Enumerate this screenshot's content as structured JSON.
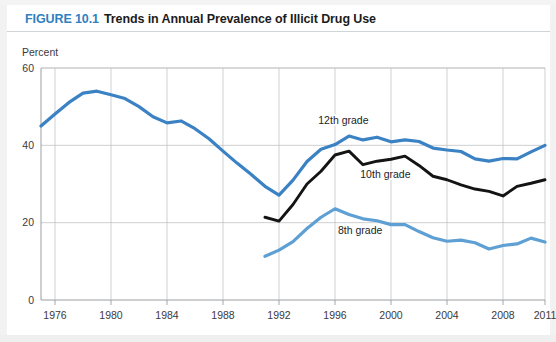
{
  "figure": {
    "number_label": "FIGURE 10.1",
    "title": "Trends in Annual Prevalence of Illicit Drug Use",
    "accent_color": "#2f7fc1"
  },
  "chart_data": {
    "type": "line",
    "title": "Trends in Annual Prevalence of Illicit Drug Use",
    "xlabel": "",
    "ylabel": "Percent",
    "ylim": [
      0,
      60
    ],
    "xlim": [
      1975,
      2011
    ],
    "yticks": [
      0,
      20,
      40,
      60
    ],
    "xticks": [
      1976,
      1980,
      1984,
      1988,
      1992,
      1996,
      2000,
      2004,
      2008,
      2011
    ],
    "xtick_labels": [
      "1976",
      "1980",
      "1984",
      "1988",
      "1992",
      "1996",
      "2000",
      "2004",
      "2008",
      "2011"
    ],
    "ytick_labels": [
      "0",
      "20",
      "40",
      "60"
    ],
    "grid": true,
    "legend": "inline-annotations",
    "series": [
      {
        "name": "12th grade",
        "color": "#3a82c4",
        "label_x": 1996.6,
        "label_y": 45.5,
        "x": [
          1975,
          1976,
          1977,
          1978,
          1979,
          1980,
          1981,
          1982,
          1983,
          1984,
          1985,
          1986,
          1987,
          1988,
          1989,
          1990,
          1991,
          1992,
          1993,
          1994,
          1995,
          1996,
          1997,
          1998,
          1999,
          2000,
          2001,
          2002,
          2003,
          2004,
          2005,
          2006,
          2007,
          2008,
          2009,
          2010,
          2011
        ],
        "values": [
          45.0,
          48.1,
          51.1,
          53.5,
          54.0,
          53.1,
          52.1,
          50.0,
          47.4,
          45.8,
          46.3,
          44.3,
          41.7,
          38.5,
          35.4,
          32.5,
          29.4,
          27.1,
          31.0,
          35.8,
          39.0,
          40.2,
          42.4,
          41.4,
          42.1,
          40.9,
          41.4,
          41.0,
          39.3,
          38.8,
          38.4,
          36.5,
          35.9,
          36.6,
          36.5,
          38.3,
          40.0
        ]
      },
      {
        "name": "10th grade",
        "color": "#141414",
        "label_x": 1999.6,
        "label_y": 31.5,
        "x": [
          1991,
          1992,
          1993,
          1994,
          1995,
          1996,
          1997,
          1998,
          1999,
          2000,
          2001,
          2002,
          2003,
          2004,
          2005,
          2006,
          2007,
          2008,
          2009,
          2010,
          2011
        ],
        "values": [
          21.4,
          20.4,
          24.7,
          30.0,
          33.3,
          37.5,
          38.5,
          35.0,
          35.9,
          36.4,
          37.2,
          34.8,
          32.0,
          31.1,
          29.8,
          28.7,
          28.1,
          26.9,
          29.4,
          30.2,
          31.1
        ]
      },
      {
        "name": "8th grade",
        "color": "#5e9fd4",
        "label_x": 1997.8,
        "label_y": 17.0,
        "x": [
          1991,
          1992,
          1993,
          1994,
          1995,
          1996,
          1997,
          1998,
          1999,
          2000,
          2001,
          2002,
          2003,
          2004,
          2005,
          2006,
          2007,
          2008,
          2009,
          2010,
          2011
        ],
        "values": [
          11.3,
          12.9,
          15.1,
          18.5,
          21.4,
          23.6,
          22.1,
          21.0,
          20.5,
          19.5,
          19.5,
          17.7,
          16.1,
          15.2,
          15.5,
          14.8,
          13.2,
          14.1,
          14.5,
          16.0,
          15.0
        ]
      }
    ]
  }
}
